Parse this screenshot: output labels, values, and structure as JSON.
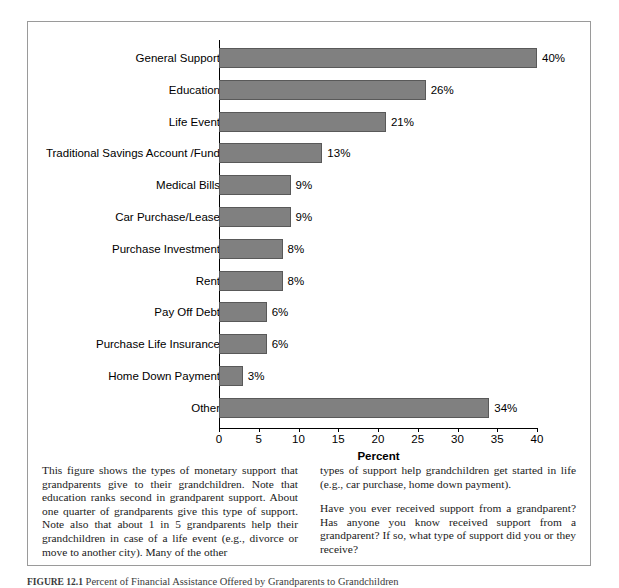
{
  "chart_data": {
    "type": "bar",
    "orientation": "horizontal",
    "title": "",
    "xlabel": "Percent",
    "ylabel": "",
    "xlim": [
      0,
      40
    ],
    "xticks": [
      0,
      5,
      10,
      15,
      20,
      25,
      30,
      35,
      40
    ],
    "grid": false,
    "legend": null,
    "bar_color": "#808080",
    "bar_border_color": "#595959",
    "categories": [
      "General Support",
      "Education",
      "Life Event",
      "Traditional Savings Account /Fund",
      "Medical Bills",
      "Car Purchase/Lease",
      "Purchase Investment",
      "Rent",
      "Pay Off Debt",
      "Purchase Life Insurance",
      "Home Down Payment",
      "Other"
    ],
    "values": [
      40,
      26,
      21,
      13,
      9,
      9,
      8,
      8,
      6,
      6,
      3,
      34
    ],
    "value_labels": [
      "40%",
      "26%",
      "21%",
      "13%",
      "9%",
      "9%",
      "8%",
      "8%",
      "6%",
      "6%",
      "3%",
      "34%"
    ]
  },
  "text_body": {
    "left_column": [
      "This figure shows the types of monetary support that grandparents give to their grandchildren. Note that education ranks second in grandparent support. About one quarter of grandparents give this type of support. Note also that about 1 in 5 grandparents help their grandchildren in case of a life event (e.g., divorce or move to another city). Many of the other"
    ],
    "right_column": [
      "types of support help grandchildren get started in life (e.g., car purchase, home down payment).",
      "Have you ever received support from a grandparent? Has anyone you know received support from a grandparent? If so, what type of support did you or they receive?"
    ]
  },
  "figure_caption": {
    "label": "FIGURE 12.1",
    "text": "Percent of Financial Assistance Offered by Grandparents to Grandchildren"
  }
}
